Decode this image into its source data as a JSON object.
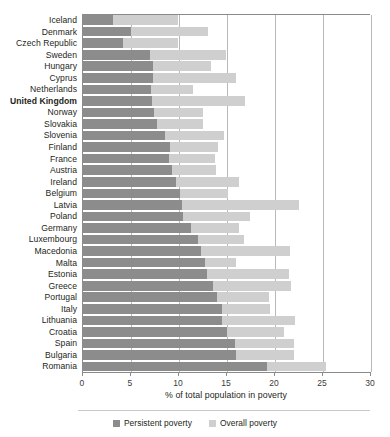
{
  "chart_data": {
    "type": "bar",
    "orientation": "horizontal",
    "stacked": false,
    "title": "",
    "xlabel": "% of total population in poverty",
    "ylabel": "",
    "xlim": [
      0,
      30
    ],
    "xticks": [
      0,
      5,
      10,
      15,
      20,
      25,
      30
    ],
    "xtick_labels": [
      "0",
      "5",
      "10",
      "15",
      "20",
      "25",
      "30"
    ],
    "grid": "vertical",
    "legend_position": "bottom",
    "highlight_category": "United Kingdom",
    "colors": {
      "persistent": "#8c8c8c",
      "overall": "#cfcfcf",
      "grid": "#b9b9b9",
      "axis": "#8a8a8a",
      "text": "#231f20"
    },
    "categories": [
      "Iceland",
      "Denmark",
      "Czech Republic",
      "Sweden",
      "Hungary",
      "Cyprus",
      "Netherlands",
      "United Kingdom",
      "Norway",
      "Slovakia",
      "Slovenia",
      "Finland",
      "France",
      "Austria",
      "Ireland",
      "Belgium",
      "Latvia",
      "Poland",
      "Germany",
      "Luxembourg",
      "Macedonia",
      "Malta",
      "Estonia",
      "Greece",
      "Portugal",
      "Italy",
      "Lithuania",
      "Croatia",
      "Spain",
      "Bulgaria",
      "Romania"
    ],
    "series": [
      {
        "name": "Persistent poverty",
        "key": "persistent",
        "values": [
          3.2,
          5.1,
          4.3,
          7.1,
          7.4,
          7.4,
          7.2,
          7.3,
          7.5,
          7.8,
          8.6,
          9.2,
          9.1,
          9.4,
          9.8,
          10.2,
          10.4,
          10.5,
          11.4,
          12.1,
          12.4,
          12.8,
          13.0,
          13.6,
          14.1,
          14.6,
          14.6,
          15.1,
          15.9,
          16.0,
          19.3
        ]
      },
      {
        "name": "Overall poverty",
        "key": "overall",
        "values": [
          10.0,
          13.1,
          10.0,
          15.0,
          13.4,
          16.0,
          11.6,
          17.0,
          12.6,
          12.6,
          14.8,
          14.2,
          13.9,
          14.0,
          16.4,
          15.2,
          22.6,
          17.5,
          16.4,
          16.9,
          21.7,
          16.0,
          21.6,
          21.8,
          19.5,
          19.6,
          22.2,
          21.0,
          22.1,
          22.1,
          25.4
        ]
      }
    ],
    "legend": [
      {
        "label": "Persistent poverty",
        "key": "persistent"
      },
      {
        "label": "Overall poverty",
        "key": "overall"
      }
    ]
  }
}
